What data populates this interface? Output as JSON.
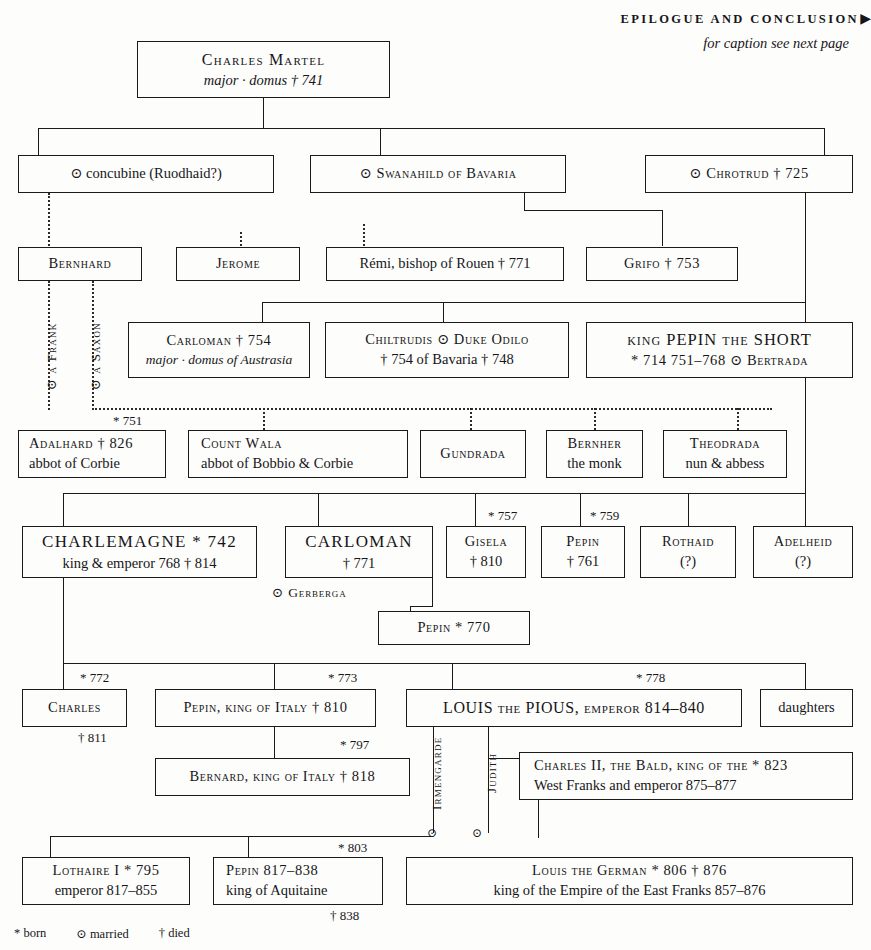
{
  "header": {
    "title": "EPILOGUE AND CONCLUSION",
    "arrow_icon": "right-triangle-icon",
    "subtitle": "for caption see next page"
  },
  "legend": {
    "born": "* born",
    "married": "⊙ married",
    "died": "† died"
  },
  "symbols": {
    "born": "*",
    "married": "⊙",
    "died": "†"
  },
  "boxes": {
    "charles_martel": {
      "l1": "Charles Martel",
      "l2": "major · domus    † 741"
    },
    "concubine": {
      "l1": "⊙ concubine (Ruodhaid?)"
    },
    "swanahild": {
      "l1": "⊙ Swanahild of Bavaria"
    },
    "chrotrud": {
      "l1": "⊙ Chrotrud † 725"
    },
    "bernhard": {
      "l1": "Bernhard"
    },
    "jerome": {
      "l1": "Jerome"
    },
    "remi": {
      "l1": "Rémi, bishop of Rouen    † 771"
    },
    "grifo": {
      "l1": "Grifo † 753"
    },
    "carloman754": {
      "l1": "Carloman    † 754",
      "l2": "major · domus of Austrasia"
    },
    "chiltrudis": {
      "l1": "Chiltrudis    ⊙ Duke Odilo",
      "l2": "† 754           of Bavaria    † 748"
    },
    "pepin_short": {
      "l1": "king PEPIN the SHORT",
      "l2": "* 714      751–768     ⊙ Bertrada"
    },
    "adalhard": {
      "l1": "Adalhard    † 826",
      "l2": "abbot of Corbie"
    },
    "wala": {
      "l1": "Count Wala",
      "l2": "abbot of Bobbio & Corbie"
    },
    "gundrada": {
      "l1": "Gundrada"
    },
    "bernher": {
      "l1": "Bernher",
      "l2": "the monk"
    },
    "theodrada": {
      "l1": "Theodrada",
      "l2": "nun & abbess"
    },
    "charlemagne": {
      "l1": "CHARLEMAGNE   * 742",
      "l2": "king & emperor   768 † 814"
    },
    "carloman771": {
      "l1": "CARLOMAN",
      "l2": "† 771"
    },
    "gisela": {
      "l1": "Gisela",
      "l2": "† 810"
    },
    "pepin761": {
      "l1": "Pepin",
      "l2": "† 761"
    },
    "rothaid": {
      "l1": "Rothaid",
      "l2": "(?)"
    },
    "adelheid": {
      "l1": "Adelheid",
      "l2": "(?)"
    },
    "pepin770": {
      "l1": "Pepin  * 770"
    },
    "charles": {
      "l1": "Charles"
    },
    "pepin_italy": {
      "l1": "Pepin, king of Italy   † 810"
    },
    "louis_pious": {
      "l1": "LOUIS the PIOUS, emperor 814–840"
    },
    "daughters": {
      "l1": "daughters"
    },
    "bernard_italy": {
      "l1": "Bernard,  king of Italy   † 818"
    },
    "charles_bald": {
      "l1": "Charles II, the Bald, king of the        * 823",
      "l2": "West Franks and emperor   875–877"
    },
    "lothaire": {
      "l1": "Lothaire I * 795",
      "l2": "emperor 817–855"
    },
    "pepin_aquitaine": {
      "l1": "Pepin      817–838",
      "l2": "king of Aquitaine"
    },
    "louis_german": {
      "l1": "Louis the German    * 806  † 876",
      "l2": "king of the Empire of the East Franks  857–876"
    }
  },
  "annotations": {
    "gerberga": "⊙ Gerberga",
    "a_frank": "⊙ a Frank",
    "a_saxon": "⊙ a Saxon",
    "irmengarde": "Irmengarde",
    "judith": "Judith",
    "b751": "* 751",
    "b757": "* 757",
    "b759": "* 759",
    "b772": "* 772",
    "b773": "* 773",
    "b778": "* 778",
    "b797": "* 797",
    "b803": "* 803",
    "d811": "† 811",
    "d838": "† 838",
    "marr_irmengarde": "⊙",
    "marr_judith": "⊙"
  }
}
